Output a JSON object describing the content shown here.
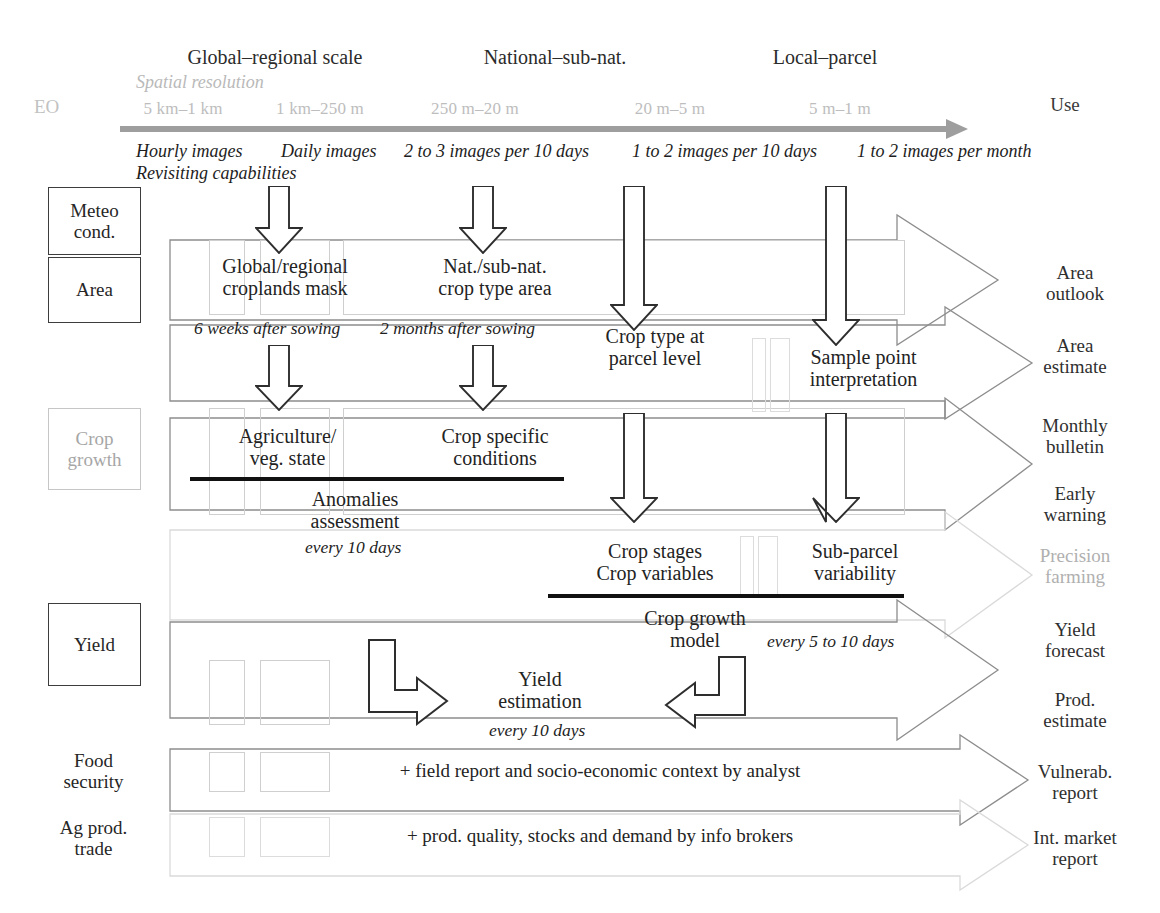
{
  "header": {
    "eo_label": "EO",
    "use_label": "Use",
    "spatial_resolution_label": "Spatial resolution",
    "scales": [
      "Global–regional scale",
      "National–sub-nat.",
      "Local–parcel"
    ],
    "resolution_ticks": [
      "5 km–1 km",
      "1 km–250 m",
      "250 m–20 m",
      "20 m–5 m",
      "5 m–1 m"
    ],
    "revisiting_label": "Revisiting capabilities",
    "revisit_frequencies": [
      "Hourly images",
      "Daily images",
      "2 to 3 images per 10 days",
      "1 to 2 images per 10 days",
      "1 to 2 images per month"
    ]
  },
  "rows": [
    {
      "label": "Meteo\ncond.",
      "boxed": true,
      "faded": false
    },
    {
      "label": "Area",
      "boxed": true,
      "faded": false
    },
    {
      "label": "Crop\ngrowth",
      "boxed": true,
      "faded": true
    },
    {
      "label": "Yield",
      "boxed": true,
      "faded": false
    },
    {
      "label": "Food\nsecurity",
      "boxed": false,
      "faded": false
    },
    {
      "label": "Ag prod.\ntrade",
      "boxed": false,
      "faded": false
    }
  ],
  "outputs": [
    {
      "label": "Area\noutlook",
      "faded": false
    },
    {
      "label": "Area\nestimate",
      "faded": false
    },
    {
      "label": "Monthly\nbulletin",
      "faded": false
    },
    {
      "label": "Early\nwarning",
      "faded": false
    },
    {
      "label": "Precision\nfarming",
      "faded": true
    },
    {
      "label": "Yield\nforecast",
      "faded": false
    },
    {
      "label": "Prod.\nestimate",
      "faded": false
    },
    {
      "label": "Vulnerab.\nreport",
      "faded": false
    },
    {
      "label": "Int. market\nreport",
      "faded": false
    }
  ],
  "products": {
    "global_croplands_mask": "Global/regional\ncroplands mask",
    "nat_subnat_crop_type_area": "Nat./sub-nat.\ncrop type area",
    "crop_type_parcel": "Crop type at\nparcel level",
    "sample_point_interpretation": "Sample point\ninterpretation",
    "agriculture_veg_state": "Agriculture/\nveg. state",
    "crop_specific_conditions": "Crop specific\nconditions",
    "anomalies_assessment": "Anomalies\nassessment",
    "crop_stages_variables": "Crop stages\nCrop variables",
    "sub_parcel_variability": "Sub-parcel\nvariability",
    "crop_growth_model": "Crop growth\nmodel",
    "yield_estimation": "Yield\nestimation",
    "field_report": "+ field report and socio-economic context by analyst",
    "prod_quality": "+ prod. quality, stocks and demand by info brokers"
  },
  "timings": {
    "six_weeks_after_sowing": "6 weeks after sowing",
    "two_months_after_sowing": "2 months after sowing",
    "every_10_days_anomalies": "every 10 days",
    "every_5_to_10_days": "every 5 to 10 days",
    "every_10_days_yield": "every 10 days"
  },
  "colors": {
    "axis": "#9e9e9e",
    "faded_text": "#b0b0b0",
    "body_text": "#262626",
    "cell_border": "#cfcfcf",
    "arrow_stroke": "#8d8d8d",
    "rule": "#111111"
  }
}
